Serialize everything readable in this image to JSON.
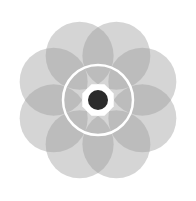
{
  "figure": {
    "center": {
      "x": 98,
      "y": 100
    },
    "petals": {
      "count": 8,
      "offset": 48,
      "radius": 34,
      "color": "#9a9a9a",
      "opacity": 0.42
    },
    "ring": {
      "radius": 35,
      "stroke": "#ffffff",
      "stroke_width": 2.5
    },
    "octagon": {
      "radius": 17,
      "fill": "#ffffff"
    },
    "dot": {
      "radius": 10,
      "fill": "#2b2b2b"
    },
    "background": "#ffffff"
  }
}
